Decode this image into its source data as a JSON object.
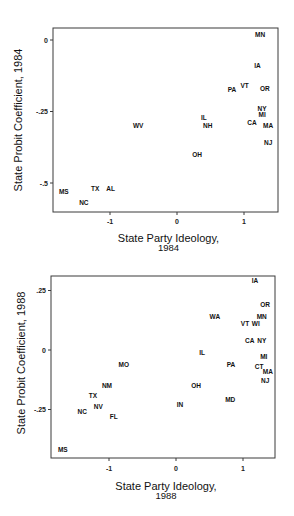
{
  "chart_data": [
    {
      "type": "scatter",
      "title": "",
      "xlabel": "State Party Ideology, 1984",
      "xlabel_lines": [
        "State Party Ideology,",
        "1984"
      ],
      "ylabel": "State Probit Coefficient, 1984",
      "xlim": [
        -1.85,
        1.5
      ],
      "ylim": [
        -0.6,
        0.05
      ],
      "xticks": [
        -1,
        0,
        1
      ],
      "xtick_labels": [
        "-1",
        "0",
        "1"
      ],
      "yticks": [
        0,
        -0.25,
        -0.5
      ],
      "ytick_labels": [
        "0",
        "-.25",
        "-.5"
      ],
      "grid": false,
      "legend": null,
      "marker": "state abbreviation labels",
      "points": [
        {
          "label": "MN",
          "x": 1.24,
          "y": 0.02
        },
        {
          "label": "IA",
          "x": 1.2,
          "y": -0.09
        },
        {
          "label": "OR",
          "x": 1.31,
          "y": -0.17
        },
        {
          "label": "VT",
          "x": 1.01,
          "y": -0.16
        },
        {
          "label": "PA",
          "x": 0.82,
          "y": -0.175
        },
        {
          "label": "NY",
          "x": 1.27,
          "y": -0.24
        },
        {
          "label": "MI",
          "x": 1.27,
          "y": -0.26
        },
        {
          "label": "CA",
          "x": 1.12,
          "y": -0.29
        },
        {
          "label": "MA",
          "x": 1.36,
          "y": -0.3
        },
        {
          "label": "NJ",
          "x": 1.36,
          "y": -0.36
        },
        {
          "label": "IL",
          "x": 0.4,
          "y": -0.27
        },
        {
          "label": "NH",
          "x": 0.46,
          "y": -0.3
        },
        {
          "label": "WV",
          "x": -0.58,
          "y": -0.3
        },
        {
          "label": "OH",
          "x": 0.3,
          "y": -0.4
        },
        {
          "label": "MS",
          "x": -1.69,
          "y": -0.53
        },
        {
          "label": "TX",
          "x": -1.22,
          "y": -0.52
        },
        {
          "label": "AL",
          "x": -0.99,
          "y": -0.52
        },
        {
          "label": "NC",
          "x": -1.39,
          "y": -0.57
        }
      ]
    },
    {
      "type": "scatter",
      "title": "",
      "xlabel": "State Party Ideology, 1988",
      "xlabel_lines": [
        "State Party Ideology,",
        "1988"
      ],
      "ylabel": "State Probit Coefficient, 1988",
      "xlim": [
        -1.85,
        1.48
      ],
      "ylim": [
        -0.45,
        0.31
      ],
      "xticks": [
        -1,
        0,
        1
      ],
      "xtick_labels": [
        "-1",
        "0",
        "1"
      ],
      "yticks": [
        0.25,
        0,
        -0.25
      ],
      "ytick_labels": [
        ".25",
        "0",
        "-.25"
      ],
      "grid": false,
      "legend": null,
      "marker": "state abbreviation labels",
      "points": [
        {
          "label": "IA",
          "x": 1.18,
          "y": 0.29
        },
        {
          "label": "OR",
          "x": 1.33,
          "y": 0.19
        },
        {
          "label": "MN",
          "x": 1.28,
          "y": 0.14
        },
        {
          "label": "WA",
          "x": 0.58,
          "y": 0.14
        },
        {
          "label": "VT",
          "x": 1.03,
          "y": 0.11
        },
        {
          "label": "WI",
          "x": 1.19,
          "y": 0.11
        },
        {
          "label": "CA",
          "x": 1.1,
          "y": 0.04
        },
        {
          "label": "NY",
          "x": 1.28,
          "y": 0.04
        },
        {
          "label": "IL",
          "x": 0.39,
          "y": -0.01
        },
        {
          "label": "MI",
          "x": 1.31,
          "y": -0.03
        },
        {
          "label": "PA",
          "x": 0.82,
          "y": -0.06
        },
        {
          "label": "CT",
          "x": 1.24,
          "y": -0.07
        },
        {
          "label": "MA",
          "x": 1.37,
          "y": -0.09
        },
        {
          "label": "NJ",
          "x": 1.33,
          "y": -0.13
        },
        {
          "label": "MO",
          "x": -0.78,
          "y": -0.06
        },
        {
          "label": "OH",
          "x": 0.3,
          "y": -0.15
        },
        {
          "label": "NM",
          "x": -1.03,
          "y": -0.15
        },
        {
          "label": "TX",
          "x": -1.24,
          "y": -0.19
        },
        {
          "label": "MD",
          "x": 0.81,
          "y": -0.21
        },
        {
          "label": "IN",
          "x": 0.06,
          "y": -0.23
        },
        {
          "label": "NV",
          "x": -1.16,
          "y": -0.24
        },
        {
          "label": "NC",
          "x": -1.4,
          "y": -0.26
        },
        {
          "label": "FL",
          "x": -0.93,
          "y": -0.28
        },
        {
          "label": "MS",
          "x": -1.69,
          "y": -0.42
        }
      ]
    }
  ]
}
